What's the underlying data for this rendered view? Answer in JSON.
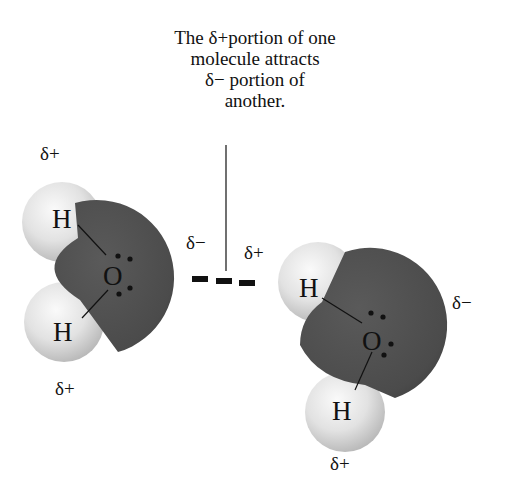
{
  "caption": {
    "lines": [
      "The δ+portion of one",
      "molecule attracts",
      "δ− portion of",
      "another."
    ]
  },
  "molecule_left": {
    "top_h_charge": "δ+",
    "bottom_h_charge": "δ+",
    "o_charge": "δ−",
    "h_top_label": "H",
    "h_bottom_label": "H",
    "o_label": "O"
  },
  "molecule_right": {
    "top_h_charge": "δ+",
    "bottom_h_charge": "δ+",
    "o_charge": "δ−",
    "h_top_label": "H",
    "h_bottom_label": "H",
    "o_label": "O"
  },
  "colors": {
    "oxygen": "#4e4e4e",
    "hydrogen": "#d9d9d9",
    "text": "#111111"
  }
}
